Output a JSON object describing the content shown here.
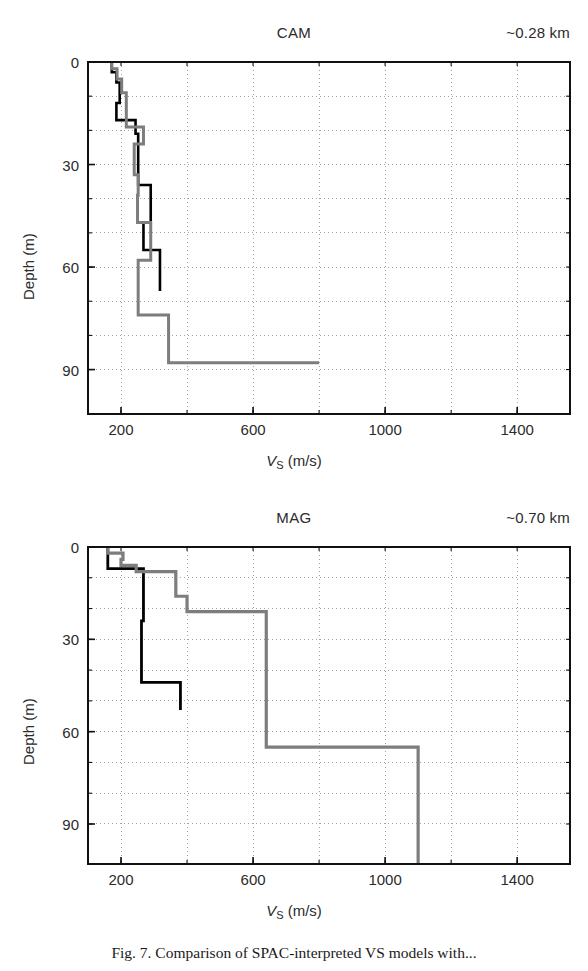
{
  "figure": {
    "caption_label": "Fig. 7.",
    "caption_text": "Comparison of SPAC-interpreted VS models with..."
  },
  "chart_data": [
    {
      "type": "line",
      "id": "cam",
      "title": "CAM",
      "annotation": "~0.28 km",
      "xlabel": "VS (m/s)",
      "ylabel": "Depth (m)",
      "xlim": [
        100,
        1560
      ],
      "ylim": [
        0,
        103
      ],
      "xticks": [
        200,
        600,
        1000,
        1400
      ],
      "yticks": [
        0,
        30,
        60,
        90
      ],
      "xgrid_minor": [
        200,
        400,
        600,
        800,
        1000,
        1200,
        1400
      ],
      "ygrid_minor": [
        0,
        10,
        20,
        30,
        40,
        50,
        60,
        70,
        80,
        90
      ],
      "grid": true,
      "series": [
        {
          "name": "black-profile",
          "color": "#000000",
          "width": 2.6,
          "points": [
            [
              172,
              0
            ],
            [
              172,
              3
            ],
            [
              186,
              3
            ],
            [
              186,
              6
            ],
            [
              196,
              6
            ],
            [
              196,
              12
            ],
            [
              186,
              12
            ],
            [
              186,
              17
            ],
            [
              244,
              17
            ],
            [
              244,
              21
            ],
            [
              252,
              21
            ],
            [
              252,
              22
            ],
            [
              252,
              36
            ],
            [
              290,
              36
            ],
            [
              290,
              45
            ],
            [
              290,
              47
            ],
            [
              268,
              47
            ],
            [
              268,
              55
            ],
            [
              318,
              55
            ],
            [
              318,
              67
            ]
          ]
        },
        {
          "name": "gray-profile",
          "color": "#7d7d7d",
          "width": 3.0,
          "points": [
            [
              172,
              0
            ],
            [
              172,
              2
            ],
            [
              188,
              2
            ],
            [
              188,
              5
            ],
            [
              202,
              5
            ],
            [
              202,
              9
            ],
            [
              216,
              9
            ],
            [
              216,
              19
            ],
            [
              268,
              19
            ],
            [
              268,
              24
            ],
            [
              240,
              24
            ],
            [
              240,
              33
            ],
            [
              252,
              33
            ],
            [
              252,
              39
            ],
            [
              250,
              39
            ],
            [
              250,
              47
            ],
            [
              290,
              47
            ],
            [
              290,
              58
            ],
            [
              252,
              58
            ],
            [
              252,
              74
            ],
            [
              344,
              74
            ],
            [
              344,
              88
            ],
            [
              800,
              88
            ]
          ]
        }
      ]
    },
    {
      "type": "line",
      "id": "mag",
      "title": "MAG",
      "annotation": "~0.70 km",
      "xlabel": "VS (m/s)",
      "ylabel": "Depth (m)",
      "xlim": [
        100,
        1560
      ],
      "ylim": [
        0,
        103
      ],
      "xticks": [
        200,
        600,
        1000,
        1400
      ],
      "yticks": [
        0,
        30,
        60,
        90
      ],
      "xgrid_minor": [
        200,
        400,
        600,
        800,
        1000,
        1200,
        1400
      ],
      "ygrid_minor": [
        0,
        10,
        20,
        30,
        40,
        50,
        60,
        70,
        80,
        90
      ],
      "grid": true,
      "series": [
        {
          "name": "black-profile",
          "color": "#000000",
          "width": 2.8,
          "points": [
            [
              160,
              0
            ],
            [
              160,
              7
            ],
            [
              268,
              7
            ],
            [
              268,
              24
            ],
            [
              262,
              24
            ],
            [
              262,
              44
            ],
            [
              380,
              44
            ],
            [
              380,
              52
            ],
            [
              380,
              53
            ]
          ]
        },
        {
          "name": "gray-profile",
          "color": "#7d7d7d",
          "width": 3.2,
          "points": [
            [
              160,
              0
            ],
            [
              160,
              2
            ],
            [
              206,
              2
            ],
            [
              206,
              4
            ],
            [
              200,
              4
            ],
            [
              200,
              6
            ],
            [
              246,
              6
            ],
            [
              246,
              8
            ],
            [
              366,
              8
            ],
            [
              366,
              16
            ],
            [
              400,
              16
            ],
            [
              400,
              21
            ],
            [
              640,
              21
            ],
            [
              640,
              65
            ],
            [
              1100,
              65
            ],
            [
              1100,
              103
            ]
          ]
        }
      ]
    }
  ]
}
